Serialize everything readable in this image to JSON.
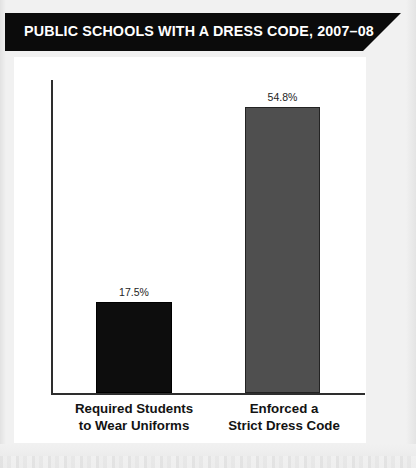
{
  "title": {
    "text": "PUBLIC SCHOOLS WITH A DRESS CODE, 2007–08",
    "background_color": "#0b0b0b",
    "text_color": "#ffffff"
  },
  "chart_data": {
    "type": "bar",
    "title": "PUBLIC SCHOOLS WITH A DRESS CODE, 2007–08",
    "xlabel": "",
    "ylabel": "",
    "ylim": [
      0,
      100
    ],
    "grid": false,
    "legend": "none",
    "categories": [
      "Required Students to Wear Uniforms",
      "Enforced a Strict Dress Code"
    ],
    "category_lines": [
      [
        "Required Students",
        "to Wear Uniforms"
      ],
      [
        "Enforced a",
        "Strict Dress Code"
      ]
    ],
    "values": [
      17.5,
      54.8
    ],
    "value_labels": [
      "17.5%",
      "54.8%"
    ],
    "bar_colors": [
      "#0d0d0d",
      "#4f4f4f"
    ],
    "bar_border_colors": [
      "#000000",
      "#232323"
    ],
    "axis_color": "#2e2e2e",
    "plot_background": "#ffffff"
  },
  "page": {
    "background_color": "#f1f1f1"
  }
}
